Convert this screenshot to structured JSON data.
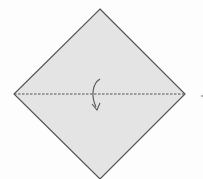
{
  "diagram": {
    "type": "origami-fold-step",
    "shape": "square-diamond",
    "fold_line": {
      "style": "dashed",
      "orientation": "horizontal",
      "position": "middle"
    },
    "arrow": {
      "semantic": "fold-down-arrow",
      "direction": "down"
    },
    "colors": {
      "paper_fill": "#e4e4e4",
      "outline": "#555555",
      "fold_line": "#555555",
      "arrow": "#555555",
      "background": "#fdfdfd"
    }
  }
}
